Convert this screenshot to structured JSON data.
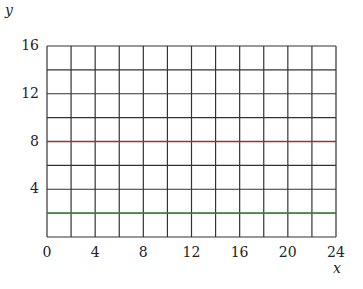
{
  "chart_data": {
    "type": "line",
    "title": "",
    "xlabel": "x",
    "ylabel": "y",
    "xlim": [
      0,
      24
    ],
    "ylim": [
      0,
      16
    ],
    "x_ticks": [
      "0",
      "4",
      "8",
      "12",
      "16",
      "20",
      "24"
    ],
    "y_ticks": [
      "4",
      "8",
      "12",
      "16"
    ],
    "grid": {
      "on": true,
      "x_step": 2,
      "y_step": 2
    },
    "series": [
      {
        "name": "red line",
        "color": "#a0302a",
        "x": [
          0,
          24
        ],
        "values": [
          8,
          8
        ]
      },
      {
        "name": "green line",
        "color": "#2e9a2e",
        "x": [
          0,
          24
        ],
        "values": [
          2,
          2
        ]
      }
    ]
  }
}
